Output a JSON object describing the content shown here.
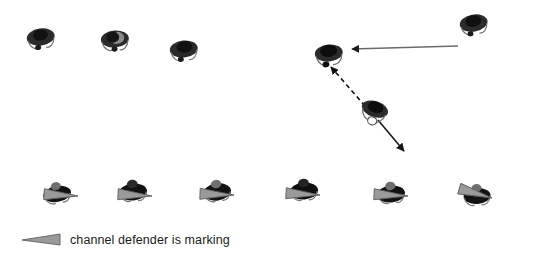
{
  "diagram": {
    "background_color": "#ffffff",
    "ink_color": "#1a1a1a",
    "cone_color": "#8c8c8c",
    "arrow_color": "#5a5a5a"
  },
  "legend": {
    "icon": "cone-marker-icon",
    "text": "channel defender is marking"
  },
  "attackers_top": [
    {
      "name": "attacker-1",
      "x": 22,
      "y": 24,
      "rotation": -8
    },
    {
      "name": "attacker-2",
      "x": 96,
      "y": 26,
      "rotation": -4
    },
    {
      "name": "attacker-3",
      "x": 165,
      "y": 36,
      "rotation": -6
    },
    {
      "name": "attacker-4",
      "x": 455,
      "y": 10,
      "rotation": -10
    }
  ],
  "midfield": [
    {
      "name": "channel-defender",
      "x": 310,
      "y": 40,
      "rotation": -6,
      "has_disc": false
    },
    {
      "name": "ball-carrier",
      "x": 355,
      "y": 97,
      "rotation": 18,
      "has_disc": true
    }
  ],
  "defenders_bottom": [
    {
      "name": "defender-1",
      "x": 38,
      "y": 178,
      "rotation": -10,
      "cone_x": 78,
      "cone_y": 190,
      "cone_rotation": 183
    },
    {
      "name": "defender-2",
      "x": 114,
      "y": 176,
      "rotation": -6,
      "cone_x": 152,
      "cone_y": 190,
      "cone_rotation": 183
    },
    {
      "name": "defender-3",
      "x": 198,
      "y": 176,
      "rotation": -8,
      "cone_x": 234,
      "cone_y": 189,
      "cone_rotation": 182
    },
    {
      "name": "defender-4",
      "x": 285,
      "y": 175,
      "rotation": -4,
      "cone_x": 320,
      "cone_y": 189,
      "cone_rotation": 183
    },
    {
      "name": "defender-5",
      "x": 372,
      "y": 178,
      "rotation": -6,
      "cone_x": 408,
      "cone_y": 190,
      "cone_rotation": 183
    },
    {
      "name": "defender-6",
      "x": 458,
      "y": 180,
      "rotation": -4,
      "cone_x": 494,
      "cone_y": 192,
      "cone_rotation": 196
    }
  ],
  "arrows": [
    {
      "name": "run-arrow-left",
      "style": "solid",
      "x1": 458,
      "y1": 46,
      "x2": 350,
      "y2": 49,
      "label": "attacker runs across to channel"
    },
    {
      "name": "pass-arrow-dashed",
      "style": "dashed",
      "x1": 365,
      "y1": 106,
      "x2": 329,
      "y2": 65,
      "label": "pass to channel receiver"
    },
    {
      "name": "carrier-run-arrow",
      "style": "solid",
      "x1": 378,
      "y1": 120,
      "x2": 406,
      "y2": 153,
      "label": "ball carrier drives forward"
    }
  ]
}
